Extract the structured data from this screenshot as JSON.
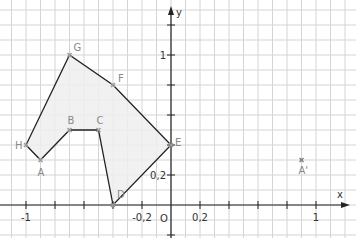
{
  "diagram": {
    "axes": {
      "x_label": "x",
      "y_label": "y",
      "origin_label": "O",
      "x_ticks": [
        {
          "value": -1,
          "label": "-1"
        },
        {
          "value": -0.8,
          "label": ""
        },
        {
          "value": -0.6,
          "label": ""
        },
        {
          "value": -0.4,
          "label": ""
        },
        {
          "value": -0.2,
          "label": "-0,2"
        },
        {
          "value": 0.2,
          "label": "0,2"
        },
        {
          "value": 0.4,
          "label": ""
        },
        {
          "value": 0.6,
          "label": ""
        },
        {
          "value": 0.8,
          "label": ""
        },
        {
          "value": 1,
          "label": "1"
        }
      ],
      "y_ticks": [
        {
          "value": 0.2,
          "label": "0,2"
        },
        {
          "value": 0.4,
          "label": ""
        },
        {
          "value": 0.6,
          "label": ""
        },
        {
          "value": 0.8,
          "label": ""
        },
        {
          "value": 1,
          "label": "1"
        },
        {
          "value": 1.2,
          "label": ""
        },
        {
          "value": -0.2,
          "label": ""
        }
      ],
      "grid_step": 0.1
    },
    "polygon": {
      "fill": "#efefef",
      "stroke": "#222222",
      "vertices": [
        {
          "name": "A",
          "x": -0.9,
          "y": 0.3
        },
        {
          "name": "B",
          "x": -0.7,
          "y": 0.5
        },
        {
          "name": "C",
          "x": -0.5,
          "y": 0.5
        },
        {
          "name": "D",
          "x": -0.4,
          "y": 0.0
        },
        {
          "name": "E",
          "x": 0.0,
          "y": 0.4
        },
        {
          "name": "F",
          "x": -0.4,
          "y": 0.8
        },
        {
          "name": "G",
          "x": -0.7,
          "y": 1.0
        },
        {
          "name": "H",
          "x": -1.0,
          "y": 0.4
        }
      ]
    },
    "extra_points": [
      {
        "name": "A'",
        "x": 0.9,
        "y": 0.3
      }
    ],
    "colors": {
      "grid": "#d4d4d4",
      "axis": "#222222",
      "point": "#9a9a9a",
      "label": "#8a8a8a"
    }
  }
}
